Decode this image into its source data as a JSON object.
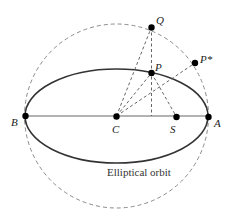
{
  "diagram": {
    "caption": "Elliptical orbit",
    "points": {
      "Q": "Q",
      "P": "P",
      "Pstar": "P*",
      "B": "B",
      "C": "C",
      "S": "S",
      "A": "A"
    },
    "colors": {
      "ellipse": "#333333",
      "circle": "#888888",
      "construction": "#555555",
      "point": "#000000"
    }
  }
}
